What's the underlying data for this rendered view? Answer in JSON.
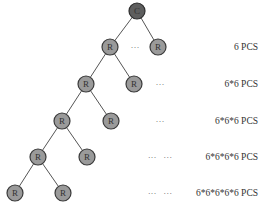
{
  "diagram": {
    "root": {
      "label": "C",
      "x": 137,
      "y": 11
    },
    "levels": [
      {
        "nodes": [
          {
            "label": "R",
            "x": 110,
            "y": 47
          },
          {
            "label": "R",
            "x": 158,
            "y": 47
          }
        ],
        "dots": {
          "text": "···",
          "x": 135,
          "y": 47
        },
        "count_label": "6 PCS",
        "count_y": 47
      },
      {
        "nodes": [
          {
            "label": "R",
            "x": 86,
            "y": 84
          },
          {
            "label": "R",
            "x": 134,
            "y": 84
          }
        ],
        "dots": {
          "text": "···",
          "x": 160,
          "y": 84
        },
        "count_label": "6*6 PCS",
        "count_y": 84
      },
      {
        "nodes": [
          {
            "label": "R",
            "x": 62,
            "y": 121
          },
          {
            "label": "R",
            "x": 111,
            "y": 121
          }
        ],
        "dots": {
          "text": "···",
          "x": 160,
          "y": 121
        },
        "count_label": "6*6*6 PCS",
        "count_y": 121
      },
      {
        "nodes": [
          {
            "label": "R",
            "x": 38,
            "y": 157
          },
          {
            "label": "R",
            "x": 87,
            "y": 157
          }
        ],
        "dots": {
          "text": "···   ···",
          "x": 160,
          "y": 157
        },
        "count_label": "6*6*6*6 PCS",
        "count_y": 157
      },
      {
        "nodes": [
          {
            "label": "R",
            "x": 15,
            "y": 193
          },
          {
            "label": "R",
            "x": 63,
            "y": 193
          }
        ],
        "dots": {
          "text": "···   ···",
          "x": 160,
          "y": 193
        },
        "count_label": "6*6*6*6*6 PCS",
        "count_y": 193
      }
    ],
    "colors": {
      "root_fill": "#5e5e5e",
      "node_fill": "#9a9a9a",
      "edge": "#555555",
      "text": "#333333"
    }
  }
}
